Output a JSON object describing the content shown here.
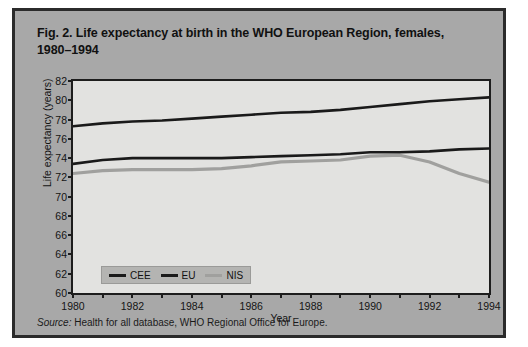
{
  "figure": {
    "title": "Fig. 2. Life expectancy at birth in the WHO European Region, females, 1980–1994",
    "title_line1": "Fig. 2. Life expectancy at birth in the WHO European Region, females,",
    "title_line2": "1980–1994",
    "source_prefix": "Source:",
    "source_text": " Health for all database, WHO Regional Office for Europe.",
    "background_color": "#a8a8a8",
    "border_color": "#2b2b2b",
    "plot_background_color": "#e2e2e0"
  },
  "chart_data": {
    "type": "line",
    "title": "Fig. 2. Life expectancy at birth in the WHO European Region, females, 1980–1994",
    "xlabel": "Year",
    "ylabel": "Life expectancy (years)",
    "xlim": [
      1980,
      1994
    ],
    "ylim": [
      60,
      82
    ],
    "ytick_step": 2,
    "yticks": [
      60,
      62,
      64,
      66,
      68,
      70,
      72,
      74,
      76,
      78,
      80,
      82
    ],
    "xticks": [
      1980,
      1981,
      1982,
      1983,
      1984,
      1985,
      1986,
      1987,
      1988,
      1989,
      1990,
      1991,
      1992,
      1993,
      1994
    ],
    "xtick_labels": [
      1980,
      1982,
      1984,
      1986,
      1988,
      1990,
      1992,
      1994
    ],
    "grid": false,
    "legend_position": "lower left inside axes",
    "x": [
      1980,
      1981,
      1982,
      1983,
      1984,
      1985,
      1986,
      1987,
      1988,
      1989,
      1990,
      1991,
      1992,
      1993,
      1994
    ],
    "series": [
      {
        "name": "CEE",
        "color": "#1a1a1a",
        "values": [
          73.4,
          73.8,
          74.0,
          74.0,
          74.0,
          74.0,
          74.1,
          74.2,
          74.3,
          74.4,
          74.6,
          74.6,
          74.7,
          74.9,
          75.0
        ]
      },
      {
        "name": "EU",
        "color": "#1a1a1a",
        "values": [
          77.3,
          77.6,
          77.8,
          77.9,
          78.1,
          78.3,
          78.5,
          78.7,
          78.8,
          79.0,
          79.3,
          79.6,
          79.9,
          80.1,
          80.3
        ]
      },
      {
        "name": "NIS",
        "color": "#a0a09e",
        "values": [
          72.4,
          72.7,
          72.8,
          72.8,
          72.8,
          72.9,
          73.2,
          73.6,
          73.7,
          73.8,
          74.2,
          74.3,
          73.6,
          72.4,
          71.5
        ]
      }
    ]
  },
  "legend": {
    "items": [
      {
        "label": "CEE",
        "color": "#1a1a1a"
      },
      {
        "label": "EU",
        "color": "#1a1a1a"
      },
      {
        "label": "NIS",
        "color": "#a0a09e"
      }
    ]
  }
}
